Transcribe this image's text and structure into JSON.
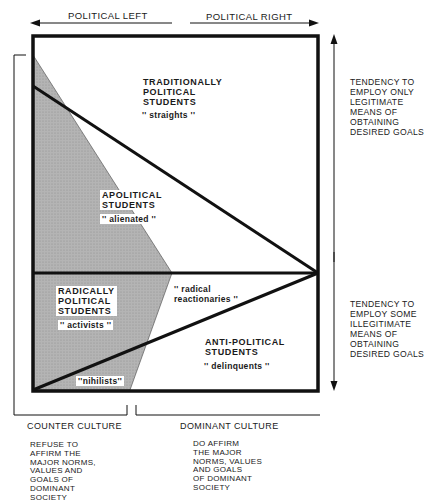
{
  "axes": {
    "top_left_label": "POLITICAL LEFT",
    "top_right_label": "POLITICAL RIGHT",
    "right_upper_note": "TENDENCY TO\nEMPLOY ONLY\nLEGITIMATE\nMEANS OF\nOBTAINING\nDESIRED GOALS",
    "right_lower_note": "TENDENCY TO\nEMPLOY SOME\nILLEGITIMATE\nMEANS OF\nOBTAINING\nDESIRED GOALS",
    "bottom_left_label": "COUNTER CULTURE",
    "bottom_right_label": "DOMINANT CULTURE",
    "bottom_left_note": "REFUSE TO\nAFFIRM THE\nMAJOR NORMS,\nVALUES AND\nGOALS OF\nDOMINANT\nSOCIETY",
    "bottom_right_note": "DO AFFIRM\nTHE MAJOR\nNORMS, VALUES\nAND GOALS\nOF DOMINANT\nSOCIETY"
  },
  "regions": [
    {
      "title": "TRADITIONALLY\nPOLITICAL\nSTUDENTS",
      "nickname": "'' straights ''"
    },
    {
      "title": "APOLITICAL\nSTUDENTS",
      "nickname": "'' alienated ''"
    },
    {
      "title": "RADICALLY\nPOLITICAL\nSTUDENTS",
      "nickname": "'' activists ''"
    },
    {
      "title": "ANTI-POLITICAL\nSTUDENTS",
      "nickname": "'' delinquents ''"
    }
  ],
  "minor_labels": {
    "radical_reactionaries": "'' radical\n  reactionaries ''",
    "nihilists": "''nihilists''"
  },
  "colors": {
    "line": "#111111",
    "shade": "#a9a9a9",
    "background": "#ffffff"
  }
}
